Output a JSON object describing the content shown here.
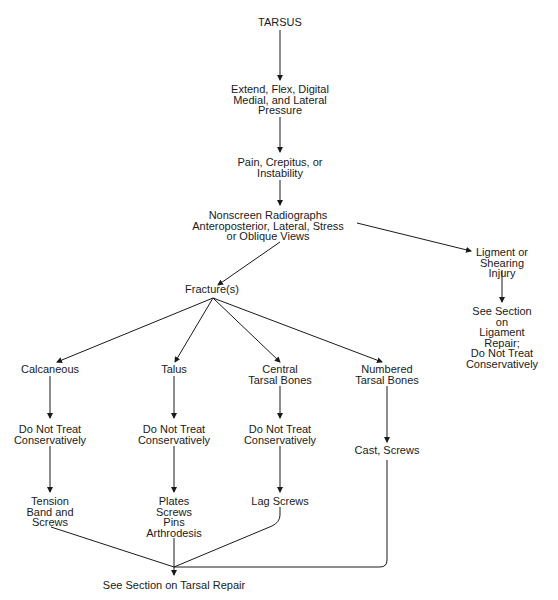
{
  "diagram": {
    "nodes": {
      "tarsus": "TARSUS",
      "exam": "Extend, Flex, Digital\nMedial, and Lateral\nPressure",
      "signs": "Pain, Crepitus, or\nInstability",
      "radiographs": "Nonscreen Radiographs\nAnteroposterior, Lateral, Stress\nor Oblique Views",
      "ligament": "Ligment or\nShearing Injury",
      "ligament_repair": "See Section on\nLigament Repair;\nDo Not Treat\nConservatively",
      "fractures": "Fracture(s)",
      "calcaneous": "Calcaneous",
      "talus": "Talus",
      "central": "Central\nTarsal Bones",
      "numbered": "Numbered\nTarsal Bones",
      "calc_dnt": "Do Not Treat\nConservatively",
      "talus_dnt": "Do Not Treat\nConservatively",
      "central_dnt": "Do Not Treat\nConservatively",
      "cast": "Cast, Screws",
      "tension": "Tension\nBand and\nScrews",
      "plates": "Plates\nScrews\nPins\nArthrodesis",
      "lag": "Lag Screws",
      "tarsal_repair": "See Section on Tarsal Repair"
    },
    "line_color": "#1a1a1a"
  }
}
